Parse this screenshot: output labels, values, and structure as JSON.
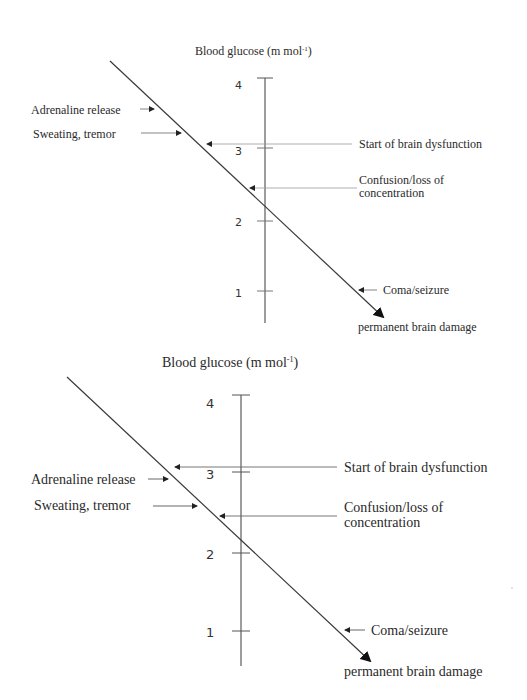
{
  "colors": {
    "line": "#3a3a3a",
    "arrow_line": "#8a8a8a",
    "text": "#2a2a2a",
    "background": "#ffffff"
  },
  "diagrams": [
    {
      "axis_title": "Blood glucose (m mol",
      "axis_title_sup": "-1",
      "axis_title_close": ")",
      "ticks": [
        "4",
        "3",
        "2",
        "1"
      ],
      "left_labels": [
        "Adrenaline release",
        "Sweating, tremor"
      ],
      "right_labels": {
        "start": "Start of brain dysfunction",
        "confusion_1": "Confusion/loss of",
        "confusion_2": "concentration",
        "coma": "Coma/seizure",
        "damage": "permanent brain damage"
      }
    },
    {
      "axis_title": "Blood glucose (m mol",
      "axis_title_sup": "-1",
      "axis_title_close": ")",
      "ticks": [
        "4",
        "3",
        "2",
        "1"
      ],
      "left_labels": [
        "Adrenaline release",
        "Sweating, tremor"
      ],
      "right_labels": {
        "start": "Start of brain dysfunction",
        "confusion_1": "Confusion/loss of",
        "confusion_2": "concentration",
        "coma": "Coma/seizure",
        "damage": "permanent brain damage"
      }
    }
  ]
}
